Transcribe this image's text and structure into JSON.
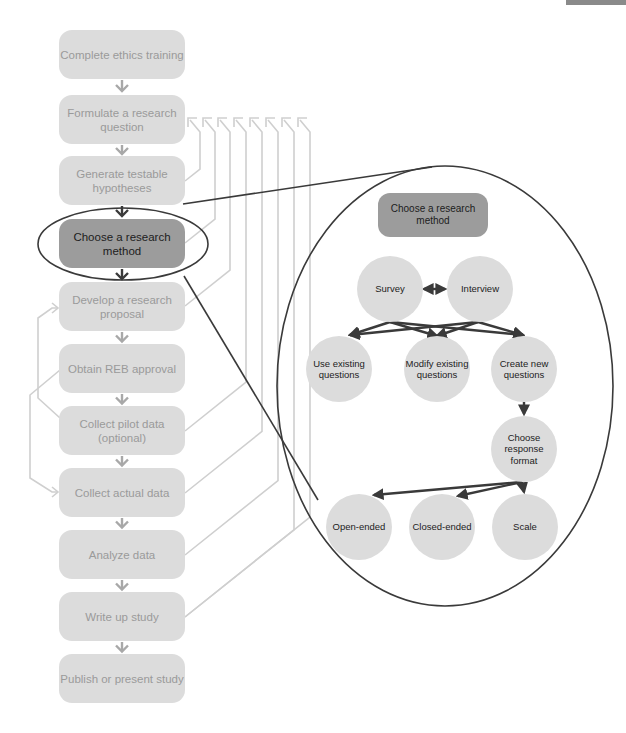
{
  "flowchart": {
    "steps": [
      {
        "label": "Complete ethics training"
      },
      {
        "label": "Formulate a research question"
      },
      {
        "label": "Generate testable hypotheses"
      },
      {
        "label": "Choose a research method",
        "highlighted": true
      },
      {
        "label": "Develop a research proposal"
      },
      {
        "label": "Obtain REB approval"
      },
      {
        "label": "Collect pilot data (optional)"
      },
      {
        "label": "Collect actual data"
      },
      {
        "label": "Analyze data"
      },
      {
        "label": "Write up study"
      },
      {
        "label": "Publish or present study"
      }
    ]
  },
  "detail": {
    "title": "Choose a research method",
    "methods": [
      "Survey",
      "Interview"
    ],
    "question_sources": [
      "Use existing questions",
      "Modify existing questions",
      "Create new questions"
    ],
    "response_step": "Choose response format",
    "formats": [
      "Open-ended",
      "Closed-ended",
      "Scale"
    ]
  },
  "colors": {
    "box_fill": "#dcdcdc",
    "box_text": "#9a9a9a",
    "active_fill": "#9c9c9c",
    "dark_text": "#1c1c1c",
    "line_light": "#cfcfcf",
    "line_dark": "#3a3a3a",
    "arrow_light": "#a8a8a8"
  }
}
